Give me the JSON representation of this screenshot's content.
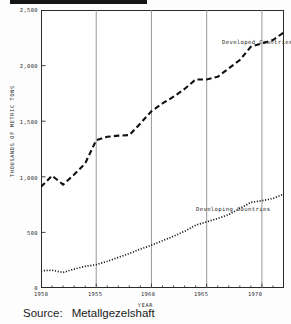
{
  "figure": {
    "source_label": "Source:",
    "source_value": "Metallgezelshaft",
    "title_bar": "redacted-title-bar"
  },
  "chart_data": {
    "type": "line",
    "title": "",
    "xlabel": "YEAR",
    "ylabel": "THOUSANDS OF METRIC TONS",
    "xlim": [
      1950,
      1972
    ],
    "ylim": [
      0,
      2500
    ],
    "xticks": [
      1950,
      1955,
      1960,
      1965,
      1970
    ],
    "xtick_labels": [
      "1950",
      "1955",
      "1960",
      "1965",
      "1970"
    ],
    "yticks": [
      0,
      500,
      1000,
      1500,
      2000,
      2500
    ],
    "ytick_labels": [
      "0",
      "500",
      "1,000",
      "1,500",
      "2,000",
      "2,500"
    ],
    "grid": "vertical-major-only",
    "legend_position": "inline-annotations",
    "x": [
      1950,
      1951,
      1952,
      1953,
      1954,
      1955,
      1956,
      1957,
      1958,
      1959,
      1960,
      1961,
      1962,
      1963,
      1964,
      1965,
      1966,
      1967,
      1968,
      1969,
      1970,
      1971,
      1972
    ],
    "series": [
      {
        "name": "Developed Countries",
        "style": "dashed",
        "color": "#111111",
        "values": [
          910,
          1010,
          930,
          1020,
          1120,
          1330,
          1360,
          1370,
          1375,
          1480,
          1590,
          1660,
          1720,
          1790,
          1875,
          1875,
          1900,
          1975,
          2050,
          2170,
          2200,
          2230,
          2300
        ]
      },
      {
        "name": "Developing Countries",
        "style": "dotted",
        "color": "#111111",
        "values": [
          155,
          160,
          140,
          170,
          195,
          210,
          240,
          275,
          310,
          350,
          385,
          425,
          465,
          510,
          565,
          595,
          625,
          660,
          715,
          770,
          785,
          805,
          845
        ]
      }
    ]
  }
}
